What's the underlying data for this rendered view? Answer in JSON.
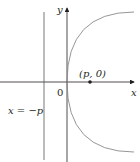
{
  "diagram": {
    "labels": {
      "y_axis": "y",
      "x_axis": "x",
      "origin": "0",
      "focus": "(p, 0)",
      "directrix": "x = −p"
    },
    "colors": {
      "axis": "#231f20",
      "curve": "#8a8a8a",
      "directrix": "#555555",
      "background": "#ffffff"
    }
  }
}
